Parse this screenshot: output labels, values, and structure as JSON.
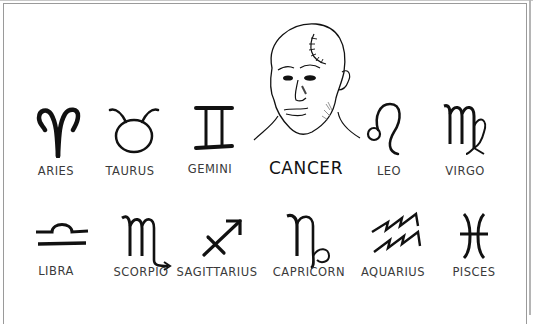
{
  "comic": {
    "description": "Zodiac chart with twelve sign glyphs; Cancer's glyph replaced by a drawing of a bald man with a surgical scar",
    "row1": [
      {
        "label": "ARIES",
        "icon": "aries-icon"
      },
      {
        "label": "TAURUS",
        "icon": "taurus-icon"
      },
      {
        "label": "GEMINI",
        "icon": "gemini-icon"
      },
      {
        "label": "CANCER",
        "icon": "bald-man-portrait"
      },
      {
        "label": "LEO",
        "icon": "leo-icon"
      },
      {
        "label": "VIRGO",
        "icon": "virgo-icon"
      }
    ],
    "row2": [
      {
        "label": "LIBRA",
        "icon": "libra-icon"
      },
      {
        "label": "SCORPIO",
        "icon": "scorpio-icon"
      },
      {
        "label": "SAGITTARIUS",
        "icon": "sagittarius-icon"
      },
      {
        "label": "CAPRICORN",
        "icon": "capricorn-icon"
      },
      {
        "label": "AQUARIUS",
        "icon": "aquarius-icon"
      },
      {
        "label": "PISCES",
        "icon": "pisces-icon"
      }
    ],
    "colors": {
      "ink": "#111111",
      "label": "#3a3a3a",
      "frame": "#9a9a9a",
      "background": "#ffffff"
    }
  }
}
